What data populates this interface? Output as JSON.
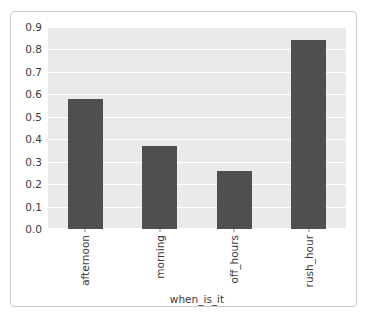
{
  "chart_data": {
    "type": "bar",
    "title": "",
    "subtitle": "",
    "xlabel": "when_is_it",
    "ylabel": "",
    "categories": [
      "afternoon",
      "morning",
      "off_hours",
      "rush_hour"
    ],
    "values": [
      0.58,
      0.37,
      0.26,
      0.84
    ],
    "ylim": [
      0.0,
      0.9
    ],
    "ytick_labels": [
      "0.0",
      "0.1",
      "0.2",
      "0.3",
      "0.4",
      "0.5",
      "0.6",
      "0.7",
      "0.8",
      "0.9"
    ],
    "ytick_values": [
      0.0,
      0.1,
      0.2,
      0.3,
      0.4,
      0.5,
      0.6,
      0.7,
      0.8,
      0.9
    ],
    "grid": true,
    "legend": null,
    "legend_position": "none",
    "annotations": [],
    "colors": {
      "bar": "#4f4f4f",
      "axes_background": "#eaeaea",
      "gridline": "#ffffff",
      "tick_label": "#3a3a3a",
      "frame_border": "#c9c9c9",
      "figure_background": "#ffffff"
    }
  }
}
